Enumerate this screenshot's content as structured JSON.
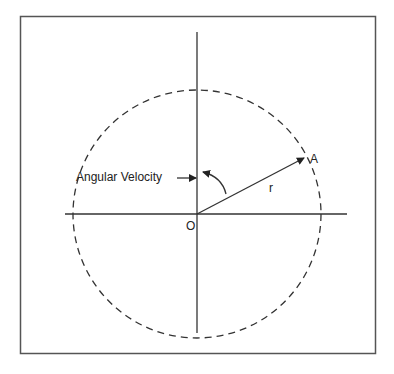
{
  "diagram": {
    "labels": {
      "angular_velocity": "Angular Velocity",
      "origin": "O",
      "point": "A",
      "radius": "r"
    },
    "colors": {
      "line": "#333333",
      "background": "#ffffff"
    },
    "geometry": {
      "center": [
        197,
        214
      ],
      "radius": 124,
      "point_A": [
        303,
        157
      ]
    }
  }
}
